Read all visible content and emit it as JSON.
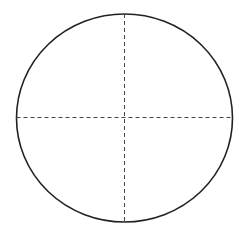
{
  "diagram": {
    "shape": "ellipse",
    "stroke_color": "#222222",
    "dash_color": "#444444",
    "ellipse": {
      "cx": 124.5,
      "cy": 118,
      "rx": 108,
      "ry": 104
    },
    "vertical_axis": {
      "x": 124.5,
      "y1": 14,
      "y2": 222
    },
    "horizontal_axis": {
      "y": 117.5,
      "x1": 16.5,
      "x2": 232.5
    }
  }
}
